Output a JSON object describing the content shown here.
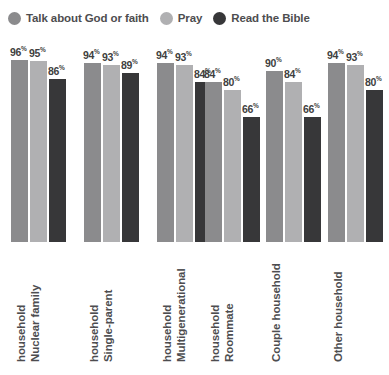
{
  "legend": {
    "items": [
      {
        "label": "Talk about God or faith",
        "color": "#8b8b8d",
        "icon": "circle-swatch-icon"
      },
      {
        "label": "Pray",
        "color": "#b0b0b2",
        "icon": "circle-swatch-icon"
      },
      {
        "label": "Read the Bible",
        "color": "#373739",
        "icon": "circle-swatch-icon"
      }
    ]
  },
  "value_suffix": "%",
  "chart_data": {
    "type": "bar",
    "title": "",
    "subtitle": "",
    "xlabel": "",
    "ylabel": "",
    "ylim": [
      0,
      100
    ],
    "grid": false,
    "legend_position": "top-left",
    "categories": [
      "Nuclear family household",
      "Single-parent household",
      "Multigenerational household",
      "Roommate household",
      "Couple household",
      "Other household"
    ],
    "category_lines": [
      [
        "Nuclear family",
        "household"
      ],
      [
        "Single-parent",
        "household"
      ],
      [
        "Multigenerational",
        "household"
      ],
      [
        "Roommate",
        "household"
      ],
      [
        "Couple household"
      ],
      [
        "Other household"
      ]
    ],
    "series": [
      {
        "name": "Talk about God or faith",
        "color": "#8b8b8d",
        "values": [
          96,
          94,
          94,
          84,
          90,
          94
        ]
      },
      {
        "name": "Pray",
        "color": "#b0b0b2",
        "values": [
          95,
          93,
          93,
          80,
          84,
          93
        ]
      },
      {
        "name": "Read the Bible",
        "color": "#373739",
        "values": [
          86,
          89,
          84,
          66,
          66,
          80
        ]
      }
    ],
    "value_labels": [
      [
        "96%",
        "95%",
        "86%"
      ],
      [
        "94%",
        "93%",
        "89%"
      ],
      [
        "94%",
        "93%",
        "84%"
      ],
      [
        "84%",
        "80%",
        "66%"
      ],
      [
        "90%",
        "84%",
        "66%"
      ],
      [
        "94%",
        "93%",
        "80%"
      ]
    ]
  }
}
